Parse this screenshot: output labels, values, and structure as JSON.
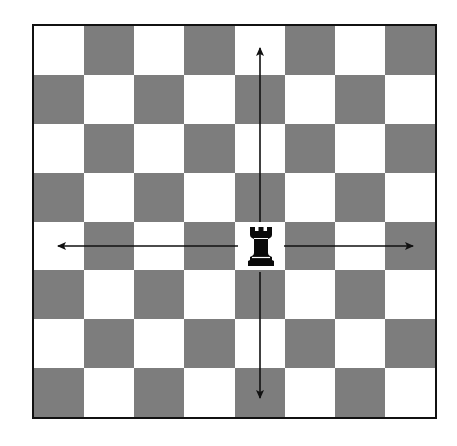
{
  "diagram": {
    "type": "chessboard-movement-diagram",
    "board": {
      "rows": 8,
      "cols": 8,
      "top_left_color": "light",
      "light_color": "#ffffff",
      "dark_color": "#7d7d7d",
      "border_color": "#111111"
    },
    "piece": {
      "name": "rook",
      "color": "black",
      "glyph": "♜",
      "row": 4,
      "col": 4
    },
    "arrows": [
      {
        "direction": "up",
        "label": ""
      },
      {
        "direction": "down",
        "label": ""
      },
      {
        "direction": "left",
        "label": ""
      },
      {
        "direction": "right",
        "label": ""
      }
    ]
  }
}
